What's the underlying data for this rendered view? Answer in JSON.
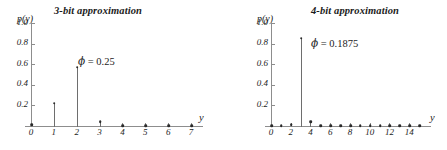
{
  "figure": {
    "background": "#ffffff",
    "axis_color": "#8d8d8d",
    "marker_color": "#2a2a2a",
    "stem_color": "#6e6e6e"
  },
  "chart_data": [
    {
      "type": "bar",
      "id": "three-bit-approximation",
      "title": "3-bit approximation",
      "xlabel": "y",
      "ylabel": "p(y)",
      "xlim": [
        0,
        7
      ],
      "ylim": [
        0,
        1.0
      ],
      "grid": false,
      "legend": null,
      "categories": [
        0,
        1,
        2,
        3,
        4,
        5,
        6,
        7
      ],
      "x_tick_labels": [
        "0",
        "1",
        "2",
        "3",
        "4",
        "5",
        "6",
        "7"
      ],
      "y_tick_labels": [
        "0.2",
        "0.4",
        "0.6",
        "0.8",
        "1.0"
      ],
      "y_ticks": [
        0.2,
        0.4,
        0.6,
        0.8,
        1.0
      ],
      "values": [
        0.02,
        0.23,
        0.58,
        0.05,
        0.01,
        0.01,
        0.01,
        0.01
      ],
      "annotation": {
        "symbol": "ϕ",
        "equals": " = ",
        "value": "0.25",
        "text": "ϕ = 0.25"
      }
    },
    {
      "type": "bar",
      "id": "four-bit-approximation",
      "title": "4-bit approximation",
      "xlabel": "y",
      "ylabel": "p(y)",
      "xlim": [
        0,
        15
      ],
      "ylim": [
        0,
        1.0
      ],
      "grid": false,
      "legend": null,
      "categories": [
        0,
        1,
        2,
        3,
        4,
        5,
        6,
        7,
        8,
        9,
        10,
        11,
        12,
        13,
        14,
        15
      ],
      "x_tick_labels": [
        "0",
        "2",
        "4",
        "6",
        "8",
        "10",
        "12",
        "14"
      ],
      "x_tick_values": [
        0,
        2,
        4,
        6,
        8,
        10,
        12,
        14
      ],
      "y_tick_labels": [
        "0.2",
        "0.4",
        "0.6",
        "0.8",
        "1.0"
      ],
      "y_ticks": [
        0.2,
        0.4,
        0.6,
        0.8,
        1.0
      ],
      "values": [
        0.01,
        0.01,
        0.02,
        0.86,
        0.05,
        0.01,
        0.01,
        0.01,
        0.01,
        0.01,
        0.01,
        0.01,
        0.01,
        0.01,
        0.01,
        0.01
      ],
      "annotation": {
        "symbol": "ϕ",
        "equals": " = ",
        "value": "0.1875",
        "text": "ϕ = 0.1875"
      }
    }
  ]
}
